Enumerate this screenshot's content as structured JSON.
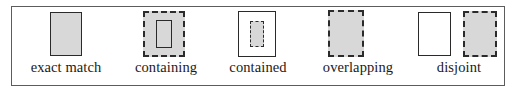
{
  "figure": {
    "kind": "spatial-relation-legend",
    "background_color": "#ffffff",
    "frame_border_color": "#5c5c5c",
    "fill_gray": "#d8d8d8",
    "outline_dark": "#2a2a2a",
    "cells": [
      {
        "id": "exact-match",
        "label": "exact match",
        "description": "one gray filled rectangle with solid dark outline; query and target coincide"
      },
      {
        "id": "containing",
        "label": "containing",
        "description": "large gray dashed rectangle enclosing a small solid-outlined rectangle"
      },
      {
        "id": "contained",
        "label": "contained",
        "description": "large white solid-outlined rectangle enclosing a small gray dashed rectangle"
      },
      {
        "id": "overlapping",
        "label": "overlapping",
        "description": "gray dashed rectangle superimposed on a solid rectangle, partially overlapping"
      },
      {
        "id": "disjoint",
        "label": "disjoint",
        "description": "a white solid-outlined rectangle beside a separate gray dashed rectangle"
      }
    ]
  }
}
